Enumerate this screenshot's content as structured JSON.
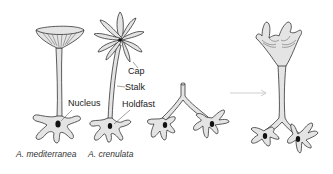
{
  "figure": {
    "labels": {
      "cap": "Cap",
      "stalk": "Stalk",
      "nucleus": "Nucleus",
      "holdfast": "Holdfast"
    },
    "captions": {
      "species_1": "A. mediterranea",
      "species_2": "A. crenulata"
    },
    "panels": [
      {
        "id": "a-mediterranea",
        "description": "Cell with umbrella-shaped cap, long stalk, nucleus in holdfast"
      },
      {
        "id": "a-crenulata",
        "description": "Cell with star-shaped cap of separate rays, stalk, nucleus in holdfast"
      },
      {
        "id": "grafted-holdfasts",
        "description": "Two holdfasts each with a nucleus joined by Y-shaped stalk stub"
      },
      {
        "id": "regenerated-cap",
        "description": "Regenerated intermediate cap on stalk above two nucleated holdfasts"
      }
    ],
    "arrow": {
      "direction": "right"
    },
    "colors": {
      "fill": "#e4e4e4",
      "stroke": "#333333",
      "nucleus": "#111111",
      "arrow": "#c8c8c8"
    }
  }
}
